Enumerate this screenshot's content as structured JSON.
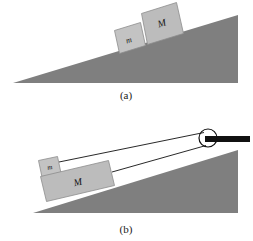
{
  "figure": {
    "background_color": "#ffffff",
    "panels": [
      {
        "id": "a",
        "caption": "(a)",
        "caption_x": 126,
        "caption_y": 95,
        "incline": {
          "fill_color": "#7f7f7f",
          "apex_left": [
            13,
            83
          ],
          "top_right": [
            238,
            15
          ],
          "base_right": [
            238,
            83
          ]
        },
        "blocks": [
          {
            "label": "m",
            "role": "small-block",
            "fill_color": "#c3c3c3",
            "stroke_color": "#8d8d8d",
            "label_x": 128,
            "label_y": 40,
            "font_size": 8,
            "points": "114.5,30.5 140.5,22.5 145.5,45.5 119.5,53.5"
          },
          {
            "label": "M",
            "role": "large-block",
            "fill_color": "#bcbcbc",
            "stroke_color": "#8d8d8d",
            "label_x": 160,
            "label_y": 25,
            "font_size": 10,
            "points": "141.5,13.5 176.5,2.5 183.5,33.5 147.5,44.5"
          }
        ]
      },
      {
        "id": "b",
        "caption": "(b)",
        "caption_x": 126,
        "caption_y": 229,
        "incline": {
          "fill_color": "#7f7f7f",
          "apex_left": [
            33,
            213
          ],
          "top_right": [
            238,
            150
          ],
          "base_right": [
            238,
            213
          ]
        },
        "blocks": [
          {
            "label": "m",
            "role": "small-block",
            "fill_color": "#c3c3c3",
            "stroke_color": "#8d8d8d",
            "label_x": 48,
            "label_y": 167,
            "font_size": 7,
            "points": "38.5,160.5 57.5,156.5 61.5,175.5 42.5,179.5"
          },
          {
            "label": "M",
            "role": "large-block",
            "fill_color": "#bcbcbc",
            "stroke_color": "#8d8d8d",
            "label_x": 77,
            "label_y": 187,
            "font_size": 10,
            "points": "40.5,176.5 108.5,160.5 114.5,185.5 46.5,201.5"
          }
        ],
        "pulley": {
          "name": "pulley-wheel",
          "center_x": 208,
          "center_y": 138,
          "radius": 9,
          "stroke_color": "#111111",
          "fill_color": "#ffffff",
          "stroke_width": 1.2
        },
        "support_bar": {
          "name": "pulley-support-bar",
          "x1": 205,
          "y1": 139,
          "x2": 250,
          "y2": 139,
          "color": "#111111",
          "thickness": 6
        },
        "strings": [
          {
            "name": "string-upper-to-m",
            "x1": 59,
            "y1": 162,
            "x2": 204,
            "y2": 133,
            "color": "#111111",
            "width": 0.9
          },
          {
            "name": "string-lower-to-M",
            "x1": 112,
            "y1": 172,
            "x2": 206,
            "y2": 145,
            "color": "#111111",
            "width": 0.9
          }
        ]
      }
    ]
  }
}
